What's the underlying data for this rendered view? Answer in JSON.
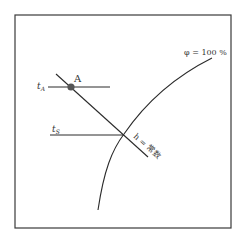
{
  "diagram": {
    "curve_label": "φ = 100 %",
    "point_label": "A",
    "tA_label": "t",
    "tA_sub": "A",
    "tS_label": "t",
    "tS_sub": "S",
    "h_label": "h = 常数",
    "colors": {
      "line": "#2b2b2b",
      "point": "#555555",
      "frame": "#3a3a3a"
    }
  }
}
